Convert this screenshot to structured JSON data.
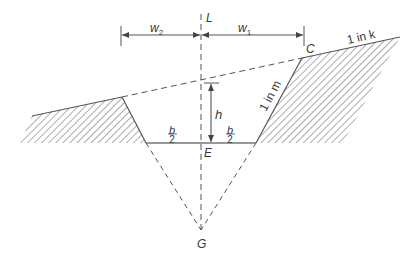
{
  "diagram": {
    "type": "cross-section of cutting on sloping ground",
    "colors": {
      "line": "#555555",
      "text": "#3a3a3a",
      "hatch": "#666666",
      "background": "#ffffff"
    },
    "labels": {
      "centerline": "L",
      "width_left": "w",
      "width_left_sub": "2",
      "width_right": "w",
      "width_right_sub": "1",
      "point_c": "C",
      "ground_slope": "1 in k",
      "side_slope": "1 in m",
      "depth": "h",
      "half_base_num_left": "b",
      "half_base_den_left": "2",
      "half_base_num_right": "b",
      "half_base_den_right": "2",
      "point_e": "E",
      "point_g": "G"
    }
  }
}
